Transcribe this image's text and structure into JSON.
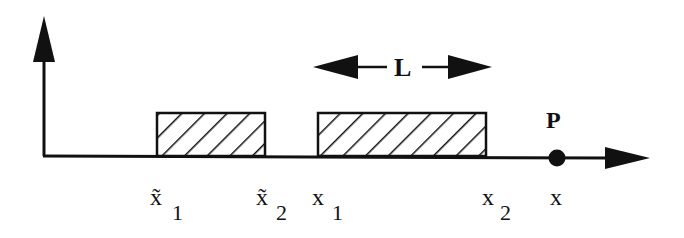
{
  "diagram": {
    "type": "1D domain schematic",
    "axes": {
      "vertical_axis": {
        "label": ""
      },
      "horizontal_axis": {
        "label": "x"
      }
    },
    "length_indicator": {
      "label": "L"
    },
    "point": {
      "label": "P",
      "position_label": "x"
    },
    "intervals": [
      {
        "name": "image-interval",
        "start_label": "x̃",
        "start_sub": "1",
        "end_label": "x̃",
        "end_sub": "2",
        "hatched": true
      },
      {
        "name": "source-interval",
        "start_label": "x",
        "start_sub": "1",
        "end_label": "x",
        "end_sub": "2",
        "hatched": true
      }
    ],
    "colors": {
      "ink": "#111111",
      "background": "#ffffff"
    }
  }
}
